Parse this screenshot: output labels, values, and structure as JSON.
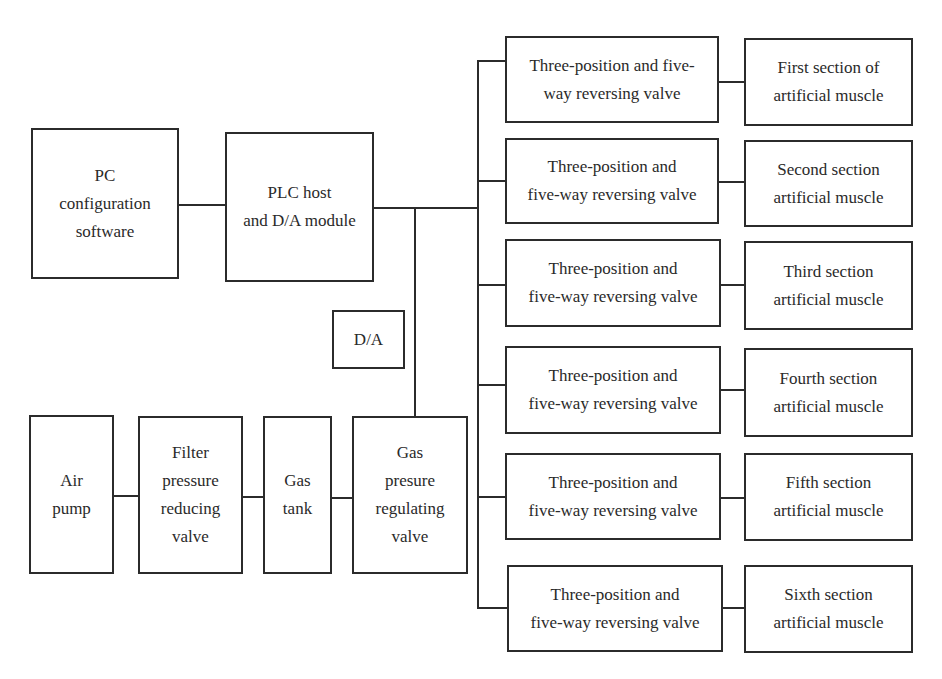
{
  "diagram": {
    "pc": {
      "label": "PC\nconfiguration\nsoftware"
    },
    "plc": {
      "label": "PLC host\nand D/A module"
    },
    "da": {
      "label": "D/A"
    },
    "air_pump": {
      "label": "Air\npump"
    },
    "filter": {
      "label": "Filter\npressure\nreducing\nvalve"
    },
    "gas_tank": {
      "label": "Gas\ntank"
    },
    "gas_regulating": {
      "label": "Gas\npresure\nregulating\nvalve"
    },
    "valves": [
      {
        "label": "Three-position  and  five-\nway reversing valve"
      },
      {
        "label": "Three-position and\nfive-way reversing valve"
      },
      {
        "label": "Three-position and\nfive-way reversing valve"
      },
      {
        "label": "Three-position and\nfive-way reversing valve"
      },
      {
        "label": "Three-position and\nfive-way reversing valve"
      },
      {
        "label": "Three-position and\nfive-way reversing valve"
      }
    ],
    "muscles": [
      {
        "label": "   First section of\nartificial muscle"
      },
      {
        "label": "Second section\nartificial muscle"
      },
      {
        "label": "Third section\nartificial muscle"
      },
      {
        "label": "Fourth section\nartificial muscle"
      },
      {
        "label": "Fifth section\nartificial muscle"
      },
      {
        "label": "Sixth section\nartificial muscle"
      }
    ]
  }
}
